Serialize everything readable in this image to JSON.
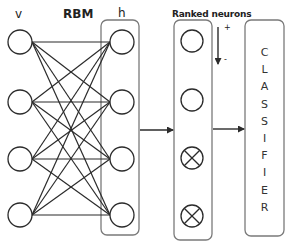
{
  "labels": {
    "visible_layer": "v",
    "hidden_layer": "h",
    "model": "RBM",
    "ranked_title": "Ranked neurons",
    "rank_high": "+",
    "rank_low": "-"
  },
  "classifier": {
    "letters": [
      "C",
      "L",
      "A",
      "S",
      "S",
      "I",
      "F",
      "I",
      "E",
      "R"
    ]
  },
  "diagram": {
    "visible_units": 4,
    "hidden_units": 4,
    "ranked_units": [
      {
        "state": "kept"
      },
      {
        "state": "kept"
      },
      {
        "state": "dropped"
      },
      {
        "state": "dropped"
      }
    ],
    "connections": "fully-connected bipartite v-h",
    "flow": [
      "RBM hidden layer",
      "Ranked neurons",
      "Classifier"
    ]
  },
  "colors": {
    "stroke": "#2b2b2b",
    "box_stroke": "#7a7a7a",
    "background": "#ffffff"
  }
}
